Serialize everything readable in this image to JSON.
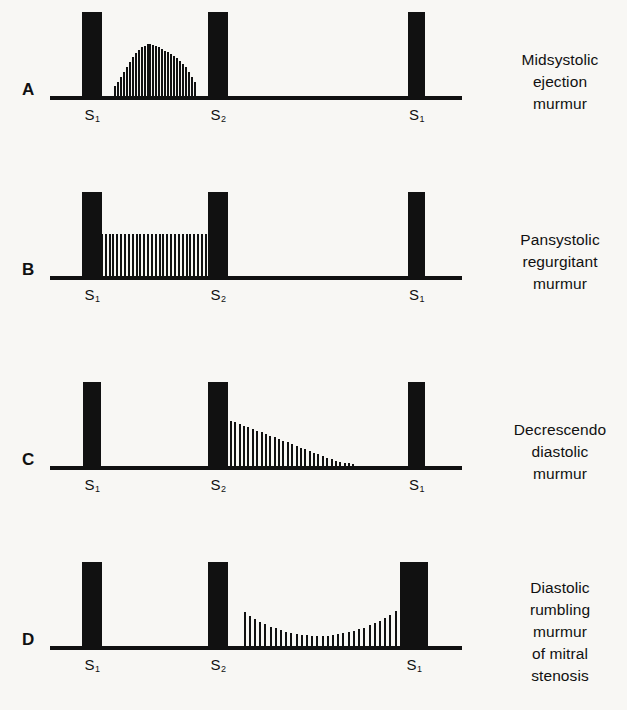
{
  "figure": {
    "background_color": "#f8f7f4",
    "ink_color": "#111111"
  },
  "panels": [
    {
      "letter": "A",
      "caption_lines": [
        "Midsystolic",
        "ejection",
        "murmur"
      ],
      "sound_labels": [
        {
          "text": "S",
          "sub": "1"
        },
        {
          "text": "S",
          "sub": "2"
        },
        {
          "text": "S",
          "sub": "1"
        }
      ]
    },
    {
      "letter": "B",
      "caption_lines": [
        "Pansystolic",
        "regurgitant",
        "murmur"
      ],
      "sound_labels": [
        {
          "text": "S",
          "sub": "1"
        },
        {
          "text": "S",
          "sub": "2"
        },
        {
          "text": "S",
          "sub": "1"
        }
      ]
    },
    {
      "letter": "C",
      "caption_lines": [
        "Decrescendo",
        "diastolic",
        "murmur"
      ],
      "sound_labels": [
        {
          "text": "S",
          "sub": "1"
        },
        {
          "text": "S",
          "sub": "2"
        },
        {
          "text": "S",
          "sub": "1"
        }
      ]
    },
    {
      "letter": "D",
      "caption_lines": [
        "Diastolic",
        "rumbling",
        "murmur",
        "of mitral",
        "stenosis"
      ],
      "sound_labels": [
        {
          "text": "S",
          "sub": "1"
        },
        {
          "text": "S",
          "sub": "2"
        },
        {
          "text": "S",
          "sub": "1"
        }
      ]
    }
  ],
  "chart_data": {
    "type": "area",
    "xlabel": "Cardiac cycle",
    "ylabel": "Murmur intensity (relative amplitude)",
    "x": "time across one cardiac cycle, normalized 0-1",
    "ylim": [
      0,
      1
    ],
    "grid": false,
    "legend": "none",
    "heart_sound_positions": {
      "S1_first": 0.08,
      "S2": 0.4,
      "S1_second": 0.88
    },
    "heart_sound_amplitude": 1.0,
    "series": [
      {
        "name": "A - Midsystolic ejection murmur",
        "panel": "A",
        "shape": "diamond (crescendo-decrescendo)",
        "phase": "systole",
        "span": [
          0.155,
          0.355
        ],
        "peak_position": 0.255,
        "peak_amplitude": 0.62,
        "values": [
          0.12,
          0.17,
          0.23,
          0.29,
          0.35,
          0.41,
          0.46,
          0.51,
          0.55,
          0.58,
          0.6,
          0.62,
          0.62,
          0.61,
          0.6,
          0.58,
          0.56,
          0.54,
          0.52,
          0.5,
          0.48,
          0.45,
          0.42,
          0.38,
          0.34,
          0.29,
          0.23,
          0.17
        ]
      },
      {
        "name": "B - Pansystolic regurgitant murmur",
        "panel": "B",
        "shape": "plateau (uniform)",
        "phase": "systole",
        "span": [
          0.105,
          0.4
        ],
        "peak_position": 0.25,
        "peak_amplitude": 0.5,
        "values": [
          0.5,
          0.5,
          0.5,
          0.5,
          0.5,
          0.5,
          0.5,
          0.5,
          0.5,
          0.5,
          0.5,
          0.5,
          0.5,
          0.5,
          0.5,
          0.5,
          0.5,
          0.5,
          0.5,
          0.5,
          0.5,
          0.5,
          0.5,
          0.5,
          0.5,
          0.5,
          0.5,
          0.5,
          0.5,
          0.5,
          0.5,
          0.5
        ]
      },
      {
        "name": "C - Decrescendo diastolic murmur",
        "panel": "C",
        "shape": "decrescendo (descending triangle)",
        "phase": "diastole (early)",
        "span": [
          0.405,
          0.74
        ],
        "peak_position": 0.405,
        "peak_amplitude": 0.6,
        "values": [
          0.6,
          0.58,
          0.56,
          0.54,
          0.52,
          0.5,
          0.48,
          0.46,
          0.44,
          0.42,
          0.4,
          0.38,
          0.36,
          0.34,
          0.32,
          0.3,
          0.28,
          0.26,
          0.24,
          0.22,
          0.2,
          0.18,
          0.16,
          0.14,
          0.12,
          0.1,
          0.08,
          0.06,
          0.05,
          0.04,
          0.03,
          0.02
        ]
      },
      {
        "name": "D - Diastolic rumbling murmur of mitral stenosis",
        "panel": "D",
        "shape": "U-shaped (decrescendo then presystolic crescendo)",
        "phase": "diastole (mid to presystolic)",
        "span": [
          0.47,
          0.88
        ],
        "peak_position": 0.88,
        "peak_amplitude": 0.58,
        "values": [
          0.4,
          0.36,
          0.32,
          0.29,
          0.26,
          0.23,
          0.21,
          0.19,
          0.17,
          0.155,
          0.145,
          0.135,
          0.13,
          0.125,
          0.12,
          0.12,
          0.125,
          0.13,
          0.14,
          0.15,
          0.165,
          0.18,
          0.2,
          0.22,
          0.245,
          0.27,
          0.3,
          0.335,
          0.375,
          0.42,
          0.47,
          0.52,
          0.58
        ]
      }
    ]
  }
}
